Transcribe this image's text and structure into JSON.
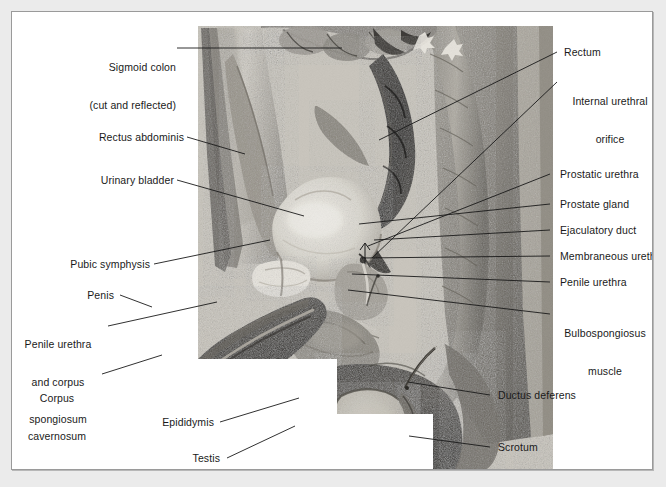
{
  "plate": {
    "title": "Male pelvis, midsagittal section",
    "background_color": "#ebebeb",
    "panel_color": "#ffffff",
    "border_color": "#9a9a9a",
    "label_color": "#1a1a1a",
    "leader_color": "#1a1a1a"
  },
  "labels": {
    "sigmoid_colon_line1": "Sigmoid colon",
    "sigmoid_colon_line2": "(cut and reflected)",
    "rectus_abdominis": "Rectus abdominis",
    "urinary_bladder": "Urinary bladder",
    "pubic_symphysis": "Pubic symphysis",
    "penis": "Penis",
    "penile_urethra_corpus_line1": "Penile urethra",
    "penile_urethra_corpus_line2": "and corpus",
    "penile_urethra_corpus_line3": "spongiosum",
    "corpus_cavernosum_line1": "Corpus",
    "corpus_cavernosum_line2": "cavernosum",
    "epididymis": "Epididymis",
    "testis": "Testis",
    "rectum": "Rectum",
    "internal_urethral_orifice_line1": "Internal urethral",
    "internal_urethral_orifice_line2": "orifice",
    "prostatic_urethra": "Prostatic urethra",
    "prostate_gland": "Prostate gland",
    "ejaculatory_duct": "Ejaculatory duct",
    "membraneous_urethra": "Membraneous urethra",
    "penile_urethra": "Penile urethra",
    "bulbospongiosus_line1": "Bulbospongiosus",
    "bulbospongiosus_line2": "muscle",
    "ductus_deferens": "Ductus deferens",
    "scrotum": "Scrotum"
  }
}
